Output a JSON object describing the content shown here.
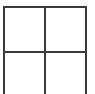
{
  "figure": {
    "name": "two-by-two-grid",
    "width": 95,
    "height": 94,
    "background_color": "#ffffff",
    "line_color": "#3a3a3a",
    "line_thickness": 2,
    "rows": 2,
    "columns": 2,
    "bottom_border_present": false,
    "top_border_present": true,
    "left_border_present": true,
    "right_border_present": true
  },
  "chart_data": {
    "type": "table",
    "title": "",
    "xlabel": "",
    "ylabel": "",
    "grid": true,
    "rows": 2,
    "columns": 2,
    "categories": [],
    "values": [],
    "cells": [
      {
        "id": "cell-top-left",
        "row": 0,
        "column": 0,
        "text": ""
      },
      {
        "id": "cell-top-right",
        "row": 0,
        "column": 1,
        "text": ""
      },
      {
        "id": "cell-bottom-left",
        "row": 1,
        "column": 0,
        "text": ""
      },
      {
        "id": "cell-bottom-right",
        "row": 1,
        "column": 1,
        "text": ""
      }
    ],
    "vertical_lines": [
      {
        "id": "left",
        "x": 3
      },
      {
        "id": "center",
        "x": 44
      },
      {
        "id": "right",
        "x": 85
      }
    ],
    "horizontal_lines": [
      {
        "id": "top",
        "y": 6
      },
      {
        "id": "middle",
        "y": 51
      }
    ],
    "annotations": []
  }
}
